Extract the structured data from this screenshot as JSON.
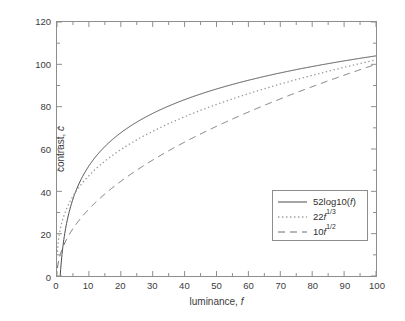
{
  "chart_data": {
    "type": "line",
    "title": "",
    "xlabel": "luminance, f",
    "ylabel": "contrast, c",
    "xlim": [
      0,
      100
    ],
    "ylim": [
      0,
      120
    ],
    "xticks": [
      0,
      10,
      20,
      30,
      40,
      50,
      60,
      70,
      80,
      90,
      100
    ],
    "yticks": [
      0,
      20,
      40,
      60,
      80,
      100,
      120
    ],
    "grid": false,
    "legend_position": "lower right",
    "x": [
      0.5,
      1,
      2,
      3,
      4,
      5,
      7,
      10,
      15,
      20,
      25,
      30,
      35,
      40,
      45,
      50,
      55,
      60,
      65,
      70,
      75,
      80,
      85,
      90,
      95,
      100
    ],
    "series": [
      {
        "name": "52log10(f)",
        "formula": "52*log10(f)",
        "style": "solid",
        "color": "#4a4a4a",
        "values": [
          -15.7,
          0,
          15.7,
          24.8,
          31.3,
          36.3,
          43.9,
          52,
          61.1,
          67.7,
          72.7,
          76.8,
          80.3,
          83.3,
          85.9,
          88.3,
          90.4,
          92.3,
          94.1,
          95.8,
          97.3,
          98.8,
          100.1,
          101.4,
          102.6,
          104
        ],
        "value_at_100": 104
      },
      {
        "name": "22f^1/3",
        "formula": "22*f^(1/3)",
        "style": "dotted",
        "color": "#9a9a9a",
        "values": [
          17.5,
          22,
          27.7,
          31.7,
          34.9,
          37.6,
          42.1,
          47.4,
          54.3,
          59.7,
          64.3,
          68.3,
          71.8,
          75.2,
          78.2,
          81.1,
          83.7,
          86.2,
          88.5,
          90.8,
          92.9,
          95,
          96.9,
          98.8,
          100.6,
          102.3
        ],
        "value_at_100": 102.3
      },
      {
        "name": "10f^1/2",
        "formula": "10*f^(1/2)",
        "style": "dashed",
        "color": "#6f6f6f",
        "values": [
          7.1,
          10,
          14.1,
          17.3,
          20,
          22.4,
          26.5,
          31.6,
          38.7,
          44.7,
          50,
          54.8,
          59.2,
          63.2,
          67.1,
          70.7,
          74.2,
          77.5,
          80.6,
          83.7,
          86.6,
          89.4,
          92.2,
          94.9,
          97.5,
          100
        ],
        "value_at_100": 100
      }
    ]
  },
  "axes": {
    "xlabel": "luminance, f",
    "ylabel": "contrast, c",
    "xtick_labels": [
      "0",
      "10",
      "20",
      "30",
      "40",
      "50",
      "60",
      "70",
      "80",
      "90",
      "100"
    ],
    "ytick_labels": [
      "0",
      "20",
      "40",
      "60",
      "80",
      "100",
      "120"
    ]
  },
  "legend": {
    "entries": [
      {
        "label": "52log10(f)",
        "label_base": "52log10(f)",
        "exponent": "",
        "style": "solid"
      },
      {
        "label": "22f^1/3",
        "label_base": "22f",
        "exponent": "1/3",
        "style": "dotted"
      },
      {
        "label": "10f^1/2",
        "label_base": "10f",
        "exponent": "1/2",
        "style": "dashed"
      }
    ]
  },
  "colors": {
    "axis": "#8d8d8d",
    "text": "#3c3c3c",
    "background": "#ffffff",
    "series_solid": "#4a4a4a",
    "series_dotted": "#9a9a9a",
    "series_dashed": "#6f6f6f"
  }
}
